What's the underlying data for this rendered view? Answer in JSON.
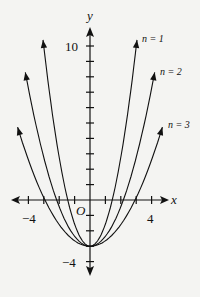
{
  "chart_data": {
    "type": "line",
    "title": "",
    "xlabel": "x",
    "ylabel": "y",
    "origin_label": "O",
    "xlim": [
      -5.1,
      5.1
    ],
    "ylim": [
      -4.8,
      11.7
    ],
    "x_tick_labels": [
      {
        "value": -4,
        "label": "−4"
      },
      {
        "value": 4,
        "label": "4"
      }
    ],
    "y_tick_labels": [
      {
        "value": 10,
        "label": "10"
      },
      {
        "value": -4,
        "label": "−4"
      }
    ],
    "x_ticks": [
      -4,
      -3,
      -2,
      -1,
      1,
      2,
      3,
      4
    ],
    "y_ticks": [
      -4,
      -3,
      -2,
      -1,
      1,
      2,
      3,
      4,
      5,
      6,
      7,
      8,
      9,
      10
    ],
    "grid": false,
    "legend": "inline labels at upper-right curve ends",
    "series": [
      {
        "name": "n = 1",
        "a": 1.44,
        "c": -3,
        "x_range": [
          -3.05,
          3.05
        ],
        "x": [
          -3.05,
          -2,
          -1.44,
          -1,
          0,
          1,
          1.44,
          2,
          3.05
        ],
        "y": [
          10.4,
          2.76,
          0,
          -1.56,
          -3,
          -1.56,
          0,
          2.76,
          10.4
        ]
      },
      {
        "name": "n = 2",
        "a": 0.64,
        "c": -3,
        "x_range": [
          -4.2,
          4.2
        ],
        "x": [
          -4.2,
          -3,
          -2.17,
          -1,
          0,
          1,
          2.17,
          3,
          4.2
        ],
        "y": [
          8.3,
          2.76,
          0,
          -2.36,
          -3,
          -2.36,
          0,
          2.76,
          8.3
        ]
      },
      {
        "name": "n = 3",
        "a": 0.35,
        "c": -3,
        "x_range": [
          -4.7,
          4.7
        ],
        "x": [
          -4.7,
          -3,
          -2.93,
          -1,
          0,
          1,
          2.93,
          3,
          4.7
        ],
        "y": [
          4.7,
          0.15,
          0,
          -2.65,
          -3,
          -2.65,
          0,
          0.15,
          4.7
        ]
      }
    ]
  },
  "labels": {
    "n1": "n = 1",
    "n2": "n = 2",
    "n3": "n = 3"
  },
  "colors": {
    "ink": "#111111",
    "paper": "#f4f4f2"
  }
}
